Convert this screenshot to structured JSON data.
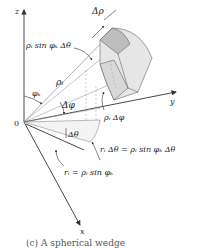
{
  "diagram": {
    "type": "spherical-wedge-volume-element",
    "axes": {
      "z": "z",
      "y": "y",
      "x": "x",
      "origin": "0"
    },
    "labels": {
      "delta_rho": "Δρ",
      "rho_sin_phi_dtheta": "ρᵢ sin φₖ Δθ",
      "rho_i": "ρᵢ",
      "phi_k": "φₖ",
      "delta_phi_1": "Δφ",
      "rho_delta_phi": "ρᵢ Δφ",
      "delta_theta": "Δθ",
      "arc_eq": "rᵢ Δθ = ρᵢ sin φₖ Δθ",
      "radius_eq": "rᵢ = ρᵢ sin φₖ"
    },
    "colors": {
      "line": "#333333",
      "wedge_fill": "#e6e6e6",
      "wedge_shade": "#c8c8c8",
      "dashed": "#999999"
    }
  },
  "caption": "(c) A spherical wedge"
}
